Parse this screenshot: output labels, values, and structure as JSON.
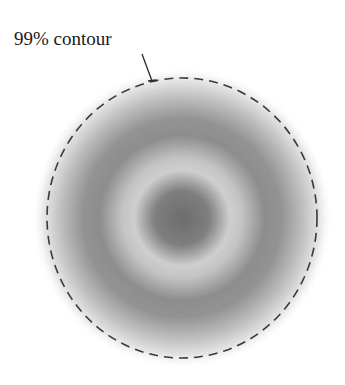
{
  "figure": {
    "annotation_label": "99% contour",
    "center": [
      182,
      218
    ],
    "contour_radius": [
      135,
      140
    ],
    "colors": {
      "background": "#ffffff",
      "contour_stroke": "#3a3a3a",
      "leader_line": "#2a2a2a",
      "center_dark": "#6e6e6e",
      "light_ring": "#cfcfcf",
      "dark_ring": "#888888",
      "outer_fade": "#ffffff"
    }
  }
}
